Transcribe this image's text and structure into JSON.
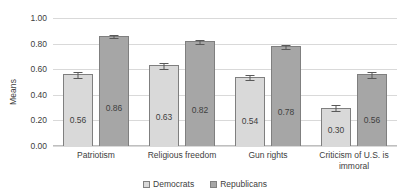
{
  "chart_data": {
    "type": "bar",
    "title": "",
    "xlabel": "",
    "ylabel": "Means",
    "ylim": [
      0,
      1.0
    ],
    "ytick_values": [
      1.0,
      0.8,
      0.6,
      0.4,
      0.2,
      0.0
    ],
    "ytick_labels": [
      "1.00",
      "0.80",
      "0.60",
      "0.40",
      "0.20",
      "0.00"
    ],
    "grid": true,
    "legend_position": "bottom-center",
    "categories": [
      "Patriotism",
      "Religious freedom",
      "Gun rights",
      "Criticism of U.S. is immoral"
    ],
    "series": [
      {
        "name": "Democrats",
        "color": "#d9d9d9",
        "values": [
          0.56,
          0.63,
          0.54,
          0.3
        ],
        "value_labels": [
          "0.56",
          "0.63",
          "0.54",
          "0.30"
        ],
        "errors": [
          0.03,
          0.025,
          0.025,
          0.03
        ]
      },
      {
        "name": "Republicans",
        "color": "#a6a6a6",
        "values": [
          0.86,
          0.82,
          0.78,
          0.56
        ],
        "value_labels": [
          "0.86",
          "0.82",
          "0.78",
          "0.56"
        ],
        "errors": [
          0.018,
          0.02,
          0.02,
          0.03
        ]
      }
    ]
  },
  "legend": {
    "items": [
      {
        "label": "Democrats",
        "swatch": "dem"
      },
      {
        "label": "Republicans",
        "swatch": "rep"
      }
    ]
  }
}
